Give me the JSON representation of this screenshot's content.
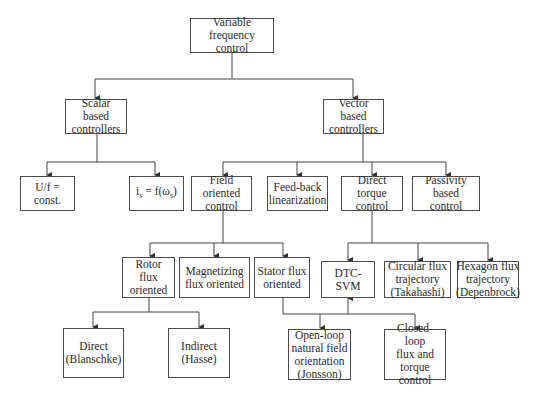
{
  "diagram": {
    "nodes": {
      "root": "Variable frequency\ncontrol",
      "scalar": "Scalar based\ncontrollers",
      "vector": "Vector based\ncontrollers",
      "uf": "U/f = const.",
      "is_f": "is = f(ωs)",
      "foc": "Field oriented\ncontrol",
      "fbl": "Feed-back\nlinearization",
      "dtc": "Direct torque\ncontrol",
      "pbc": "Passivity based\ncontrol",
      "rotor": "Rotor flux\noriented",
      "magnetizing": "Magnetizing\nflux oriented",
      "stator": "Stator flux\noriented",
      "dtcsvm": "DTC-SVM",
      "circular": "Circular flux\ntrajectory\n(Takahashi)",
      "hexagon": "Hexagon flux\ntrajectory\n(Depenbrock)",
      "direct": "Direct\n(Blanschke)",
      "indirect": "Indirect\n(Hasse)",
      "openloop": "Open-loop\nnatural field\norientation\n(Jonsson)",
      "closedloop": "Closed-loop\nflux and\ntorque\ncontrol"
    },
    "is_f_parts": {
      "i": "i",
      "i_sub": "s",
      "mid": " = f(ω",
      "w_sub": "s",
      "end": ")"
    },
    "edges": [
      [
        "root",
        "scalar"
      ],
      [
        "root",
        "vector"
      ],
      [
        "scalar",
        "uf"
      ],
      [
        "scalar",
        "is_f"
      ],
      [
        "vector",
        "foc"
      ],
      [
        "vector",
        "fbl"
      ],
      [
        "vector",
        "dtc"
      ],
      [
        "vector",
        "pbc"
      ],
      [
        "foc",
        "rotor"
      ],
      [
        "foc",
        "magnetizing"
      ],
      [
        "foc",
        "stator"
      ],
      [
        "dtc",
        "dtcsvm"
      ],
      [
        "dtc",
        "circular"
      ],
      [
        "dtc",
        "hexagon"
      ],
      [
        "rotor",
        "direct"
      ],
      [
        "rotor",
        "indirect"
      ],
      [
        "stator",
        "openloop"
      ],
      [
        "stator",
        "closedloop"
      ],
      [
        "stator",
        "dtcsvm"
      ]
    ]
  }
}
